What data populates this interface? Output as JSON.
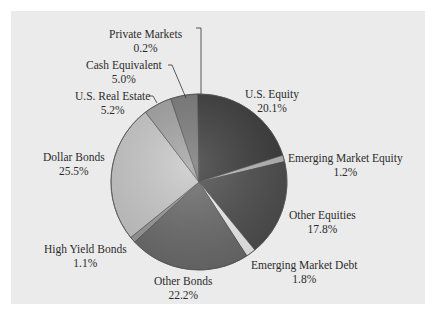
{
  "chart_data": {
    "type": "pie",
    "title": "",
    "start_angle_deg": 0,
    "direction": "clockwise",
    "slices": [
      {
        "label": "U.S. Equity",
        "value": 20.1,
        "pct": "20.1%",
        "color": "#3c3c3c"
      },
      {
        "label": "Emerging Market Equity",
        "value": 1.2,
        "pct": "1.2%",
        "color": "#b9b9b9"
      },
      {
        "label": "Other Equities",
        "value": 17.8,
        "pct": "17.8%",
        "color": "#4e4e4e"
      },
      {
        "label": "Emerging Market Debt",
        "value": 1.8,
        "pct": "1.8%",
        "color": "#f2f2f2"
      },
      {
        "label": "Other Bonds",
        "value": 22.2,
        "pct": "22.2%",
        "color": "#6c6c6c"
      },
      {
        "label": "High Yield Bonds",
        "value": 1.1,
        "pct": "1.1%",
        "color": "#9a9a9a"
      },
      {
        "label": "Dollar Bonds",
        "value": 25.5,
        "pct": "25.5%",
        "color": "#c9c9c9"
      },
      {
        "label": "U.S. Real Estate",
        "value": 5.2,
        "pct": "5.2%",
        "color": "#a3a3a3"
      },
      {
        "label": "Cash Equivalent",
        "value": 5.0,
        "pct": "5.0%",
        "color": "#7a7a7a"
      },
      {
        "label": "Private Markets",
        "value": 0.2,
        "pct": "0.2%",
        "color": "#2e2e2e"
      }
    ],
    "legend": "none (direct labels)"
  },
  "labels": {
    "us_equity": {
      "name": "U.S. Equity",
      "pct": "20.1%"
    },
    "em_equity": {
      "name": "Emerging Market Equity",
      "pct": "1.2%"
    },
    "other_equities": {
      "name": "Other Equities",
      "pct": "17.8%"
    },
    "em_debt": {
      "name": "Emerging Market Debt",
      "pct": "1.8%"
    },
    "other_bonds": {
      "name": "Other Bonds",
      "pct": "22.2%"
    },
    "high_yield": {
      "name": "High Yield Bonds",
      "pct": "1.1%"
    },
    "dollar_bonds": {
      "name": "Dollar Bonds",
      "pct": "25.5%"
    },
    "us_real_estate": {
      "name": "U.S. Real Estate",
      "pct": "5.2%"
    },
    "cash": {
      "name": "Cash Equivalent",
      "pct": "5.0%"
    },
    "private_markets": {
      "name": "Private Markets",
      "pct": "0.2%"
    }
  }
}
